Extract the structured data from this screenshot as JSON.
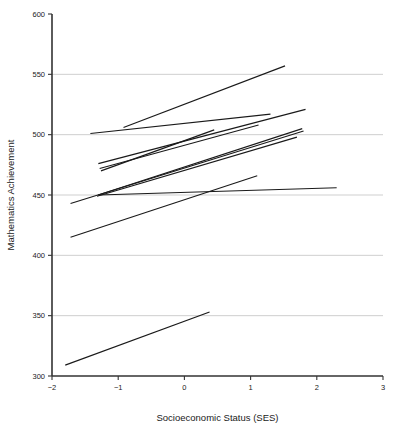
{
  "chart_data": {
    "type": "line",
    "title": "",
    "xlabel": "Socioeconomic Status (SES)",
    "ylabel": "Mathematics Achievement",
    "xlim": [
      -2,
      3
    ],
    "ylim": [
      300,
      600
    ],
    "xticks": [
      -2,
      -1,
      0,
      1,
      2,
      3
    ],
    "xtick_labels": [
      "-2",
      "-1",
      "0",
      "1",
      "2",
      "3"
    ],
    "yticks": [
      300,
      350,
      400,
      450,
      500,
      550,
      600
    ],
    "ytick_labels": [
      "300",
      "350",
      "400",
      "450",
      "500",
      "550",
      "600"
    ],
    "grid": "horizontal",
    "legend": "none",
    "series": [
      {
        "name": "school-1",
        "x": [
          -0.92,
          1.52
        ],
        "y": [
          506,
          557
        ]
      },
      {
        "name": "school-2",
        "x": [
          -1.42,
          1.3
        ],
        "y": [
          501,
          517
        ]
      },
      {
        "name": "school-3",
        "x": [
          -1.3,
          1.83
        ],
        "y": [
          476,
          521
        ]
      },
      {
        "name": "school-4",
        "x": [
          -1.28,
          1.12
        ],
        "y": [
          472,
          508
        ]
      },
      {
        "name": "school-5",
        "x": [
          -1.26,
          0.45
        ],
        "y": [
          470,
          504
        ]
      },
      {
        "name": "school-6",
        "x": [
          -1.3,
          1.78
        ],
        "y": [
          450,
          505
        ]
      },
      {
        "name": "school-7",
        "x": [
          -1.32,
          1.7
        ],
        "y": [
          449,
          498
        ]
      },
      {
        "name": "school-8",
        "x": [
          -1.72,
          1.8
        ],
        "y": [
          443,
          503
        ]
      },
      {
        "name": "school-9",
        "x": [
          -1.3,
          2.3
        ],
        "y": [
          450,
          456
        ]
      },
      {
        "name": "school-10",
        "x": [
          -1.72,
          1.1
        ],
        "y": [
          415,
          466
        ]
      },
      {
        "name": "school-11",
        "x": [
          -1.8,
          0.38
        ],
        "y": [
          309,
          353
        ]
      }
    ]
  },
  "style": {
    "line_color": "#1a1a1a",
    "axis_color": "#333333",
    "grid_color": "#c9c9c9",
    "background": "#ffffff"
  }
}
